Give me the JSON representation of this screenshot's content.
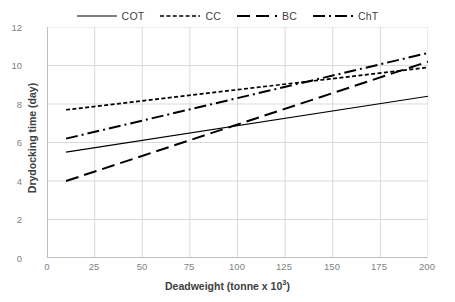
{
  "chart_data": {
    "type": "line",
    "title": "",
    "xlabel": "Deadweight (tonne x 10",
    "xlabel_sup": "3",
    "xlabel_tail": ")",
    "ylabel": "Drydocking time (day)",
    "xlim": [
      0,
      200
    ],
    "ylim": [
      0,
      12
    ],
    "xticks": [
      0,
      25,
      50,
      75,
      100,
      125,
      150,
      175,
      200
    ],
    "yticks": [
      0,
      2,
      4,
      6,
      8,
      10,
      12
    ],
    "grid": "horizontal-and-vertical",
    "legend_position": "top-center",
    "x": [
      10,
      200
    ],
    "series": [
      {
        "name": "COT",
        "values": [
          5.5,
          8.4
        ],
        "style": "solid",
        "color": "#000000"
      },
      {
        "name": "CC",
        "values": [
          7.7,
          9.9
        ],
        "style": "fine-dotted",
        "color": "#000000"
      },
      {
        "name": "BC",
        "values": [
          4.0,
          10.2
        ],
        "style": "long-dashed",
        "color": "#000000"
      },
      {
        "name": "ChT",
        "values": [
          6.2,
          10.65
        ],
        "style": "dash-dot",
        "color": "#000000"
      }
    ]
  },
  "legend": {
    "items": [
      {
        "label": "COT"
      },
      {
        "label": "CC"
      },
      {
        "label": "BC"
      },
      {
        "label": "ChT"
      }
    ]
  },
  "axes": {
    "y_title": "Drydocking time (day)",
    "x_title_main": "Deadweight (tonne x 10",
    "x_title_sup": "3",
    "x_title_end": ")",
    "y_tick_labels": [
      "12",
      "10",
      "8",
      "6",
      "4",
      "2",
      "0"
    ],
    "x_tick_labels": [
      "0",
      "25",
      "50",
      "75",
      "100",
      "125",
      "150",
      "175",
      "200"
    ]
  },
  "colors": {
    "line": "#000000",
    "grid": "#d9d9d9",
    "axis": "#bfbfbf",
    "tick_text": "#7f7f7f",
    "title_text": "#404040"
  }
}
